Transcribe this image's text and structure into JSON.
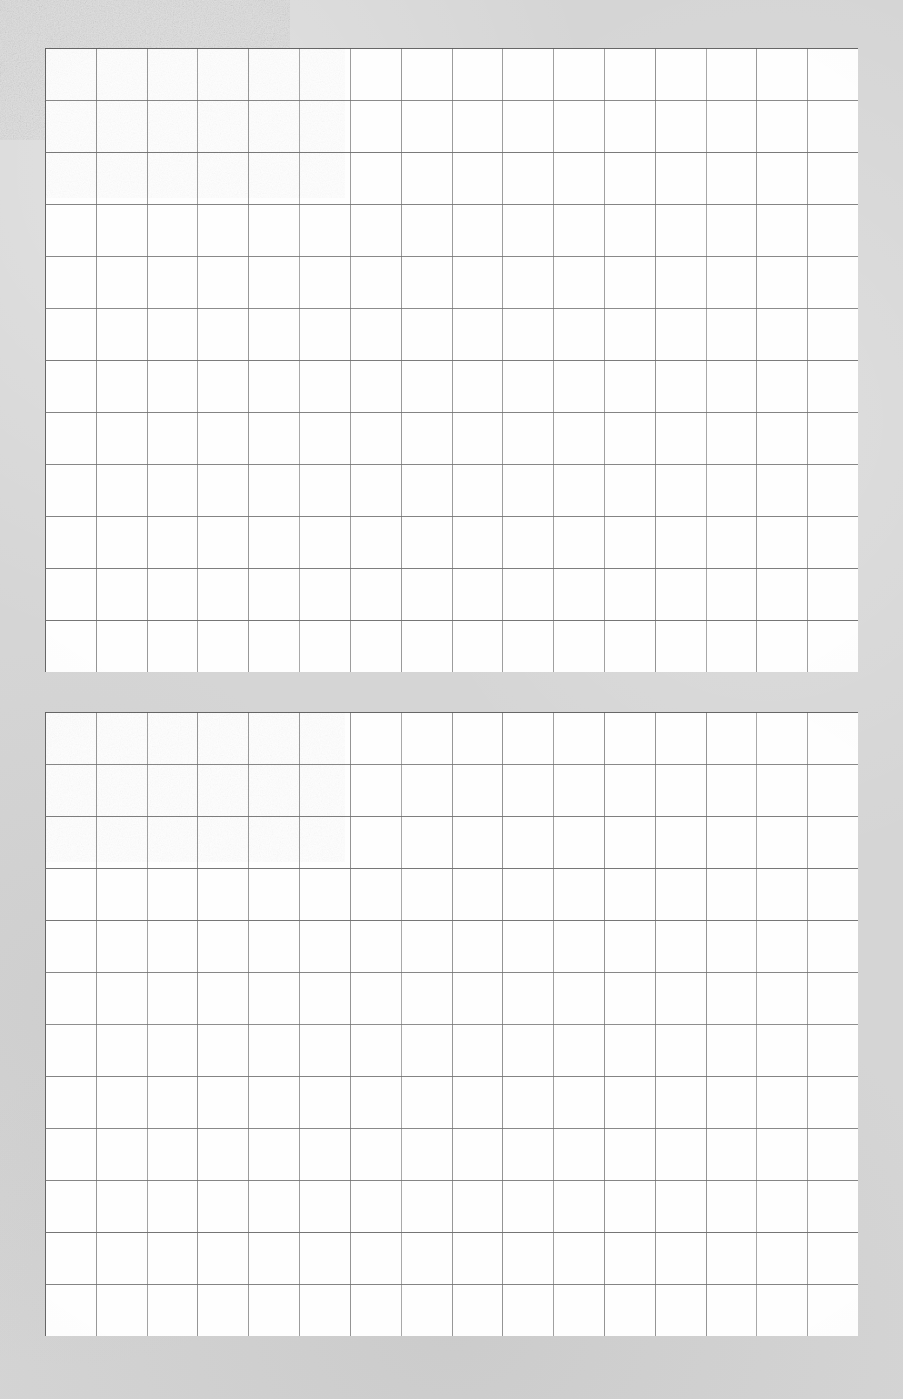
{
  "document": {
    "kind": "scanned-grid-paper",
    "title": "Scanned grid paper sheet",
    "width": 903,
    "height": 1399,
    "description": "Scan of two blank square-ruled grid paper blocks on a gray scanner background. No printed text, labels, numbers or handwriting are present anywhere on the page."
  },
  "colors": {
    "scanner_background": "#d5d5d5",
    "paper_white": "#fefefe",
    "grid_line": "#8d8d8d",
    "grid_line_strong": "#6f6f6f",
    "grid_border": "#5f5f5f"
  },
  "blocks": [
    {
      "id": "grid-block-top",
      "label": "Top grid block",
      "x": 45,
      "y": 48,
      "width": 813,
      "height": 624,
      "columns": 16,
      "rows": 12,
      "cell_width": 50.81,
      "cell_height": 52.0,
      "content": ""
    },
    {
      "id": "grid-block-bottom",
      "label": "Bottom grid block",
      "x": 45,
      "y": 712,
      "width": 813,
      "height": 624,
      "columns": 16,
      "rows": 12,
      "cell_width": 50.81,
      "cell_height": 52.0,
      "content": ""
    }
  ],
  "gap": {
    "label": "Gutter between grid blocks",
    "y": 672,
    "height": 40
  },
  "margins": {
    "left": 45,
    "right": 45,
    "top": 48,
    "bottom": 63
  }
}
